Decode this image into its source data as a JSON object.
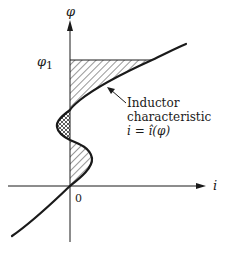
{
  "figure": {
    "axes": {
      "y_label": "φ",
      "x_label": "i",
      "origin_label": "0",
      "phi1_label_main": "φ",
      "phi1_label_sub": "1"
    },
    "annotation": {
      "line1": "Inductor",
      "line2": "characteristic",
      "line3": "i = î(φ)"
    },
    "regions": [
      {
        "name": "upper-hatched-area",
        "pattern": "diagonal-hatch"
      },
      {
        "name": "cross-hatched-area",
        "pattern": "cross-hatch"
      },
      {
        "name": "lower-hatched-area",
        "pattern": "diagonal-hatch"
      }
    ],
    "colors": {
      "ink": "#1a1a1a",
      "background": "#ffffff"
    }
  }
}
